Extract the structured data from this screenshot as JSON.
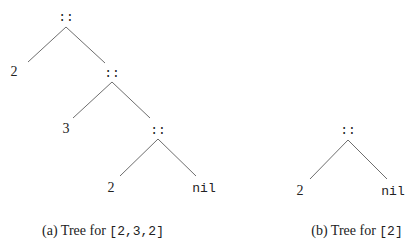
{
  "figures": [
    {
      "id": "a",
      "caption_prefix": "(a) Tree for ",
      "caption_code": "[2,3,2]",
      "nodes": [
        {
          "label": "::",
          "kind": "cons"
        },
        {
          "label": "2",
          "kind": "value"
        },
        {
          "label": "::",
          "kind": "cons"
        },
        {
          "label": "3",
          "kind": "value"
        },
        {
          "label": "::",
          "kind": "cons"
        },
        {
          "label": "2",
          "kind": "value"
        },
        {
          "label": "nil",
          "kind": "nil"
        }
      ]
    },
    {
      "id": "b",
      "caption_prefix": "(b) Tree for ",
      "caption_code": "[2]",
      "nodes": [
        {
          "label": "::",
          "kind": "cons"
        },
        {
          "label": "2",
          "kind": "value"
        },
        {
          "label": "nil",
          "kind": "nil"
        }
      ]
    }
  ],
  "colors": {
    "edge": "#6e6e6e",
    "text": "#222222",
    "background": "#ffffff"
  }
}
